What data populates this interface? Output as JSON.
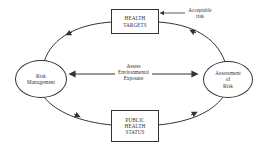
{
  "diagram": {
    "nodes": {
      "health_targets": {
        "lines": [
          "HEALTH",
          "TARGETS"
        ],
        "shape": "rectangle"
      },
      "public_health_status": {
        "lines": [
          "PUBLIC",
          "HEALTH",
          "STATUS"
        ],
        "shape": "rectangle"
      },
      "risk_management": {
        "lines": [
          "Risk",
          "Management"
        ],
        "shape": "ellipse"
      },
      "assessment_of_risk": {
        "lines": [
          "Assessment",
          "of",
          "Risk"
        ],
        "shape": "ellipse"
      }
    },
    "center_label": {
      "lines": [
        "Assess",
        "Environmental",
        "Exposure"
      ]
    },
    "annotation": {
      "lines": [
        "Acceptable",
        "risk"
      ]
    },
    "edges": [
      {
        "from": "health_targets",
        "to": "risk_management",
        "direction": "arrow"
      },
      {
        "from": "risk_management",
        "to": "public_health_status",
        "direction": "arrow"
      },
      {
        "from": "public_health_status",
        "to": "assessment_of_risk",
        "direction": "arrow"
      },
      {
        "from": "assessment_of_risk",
        "to": "health_targets",
        "direction": "arrow"
      },
      {
        "from": "risk_management",
        "to": "assessment_of_risk",
        "direction": "bidirectional",
        "label": "center_label"
      },
      {
        "from": "annotation",
        "to": "health_targets",
        "direction": "arrow"
      }
    ],
    "colors": {
      "stroke": "#333333",
      "background": "#ffffff"
    }
  }
}
